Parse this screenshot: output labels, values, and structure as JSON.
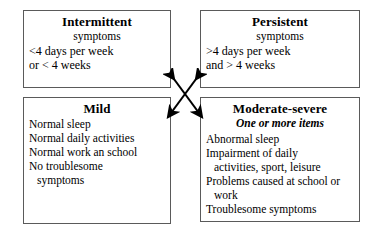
{
  "diagram": {
    "boxes": {
      "intermittent": {
        "heading": "Intermittent",
        "subheading": "symptoms",
        "lines": [
          "<4 days per week",
          "or < 4 weeks"
        ]
      },
      "persistent": {
        "heading": "Persistent",
        "subheading": "symptoms",
        "lines": [
          ">4 days per week",
          "and > 4 weeks"
        ]
      },
      "mild": {
        "heading": "Mild",
        "lines": [
          "Normal sleep",
          "Normal daily activities",
          "Normal work an school",
          "No troublesome",
          "symptoms"
        ]
      },
      "moderate_severe": {
        "heading": "Moderate-severe",
        "subheading": "One or more items",
        "lines": [
          "Abnormal sleep",
          "Impairment of daily",
          "activities, sport, leisure",
          "Problems caused at school or",
          "work",
          "Troublesome symptoms"
        ]
      }
    },
    "connector": {
      "name": "double-headed-cross-arrows",
      "description": "Two crossing double-headed arrows linking the four boxes",
      "color": "#000000"
    },
    "colors": {
      "border": "#5a5a5a",
      "text": "#000000",
      "background": "#ffffff"
    }
  }
}
